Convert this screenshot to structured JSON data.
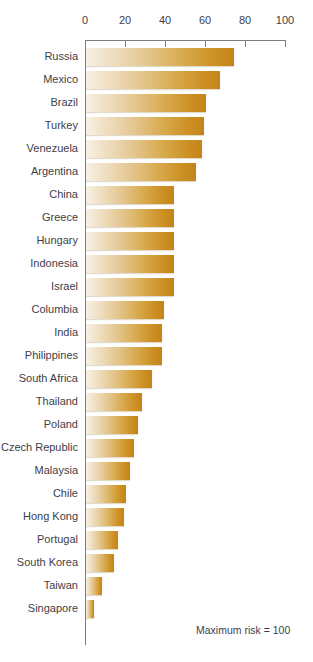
{
  "footnote": "Maximum risk = 100",
  "chart_data": {
    "type": "bar",
    "orientation": "horizontal",
    "title": "",
    "subtitle": "",
    "xlabel": "",
    "ylabel": "",
    "xlim": [
      0,
      100
    ],
    "xticks": [
      0,
      20,
      40,
      60,
      80,
      100
    ],
    "xtick_labels": [
      "0",
      "20",
      "40",
      "60",
      "80",
      "100"
    ],
    "grid": false,
    "legend": null,
    "annotations": [
      "Maximum risk = 100"
    ],
    "bar_color_start": "#f8f1e4",
    "bar_color_end": "#c4841b",
    "axis_color": "#7c7c88",
    "categories": [
      "Russia",
      "Mexico",
      "Brazil",
      "Turkey",
      "Venezuela",
      "Argentina",
      "China",
      "Greece",
      "Hungary",
      "Indonesia",
      "Israel",
      "Columbia",
      "India",
      "Philippines",
      "South Africa",
      "Thailand",
      "Poland",
      "Czech Republic",
      "Malaysia",
      "Chile",
      "Hong Kong",
      "Portugal",
      "South Korea",
      "Taiwan",
      "Singapore"
    ],
    "values": [
      74,
      67,
      60,
      59,
      58,
      55,
      44,
      44,
      44,
      44,
      44,
      39,
      38,
      38,
      33,
      28,
      26,
      24,
      22,
      20,
      19,
      16,
      14,
      8,
      4
    ]
  }
}
